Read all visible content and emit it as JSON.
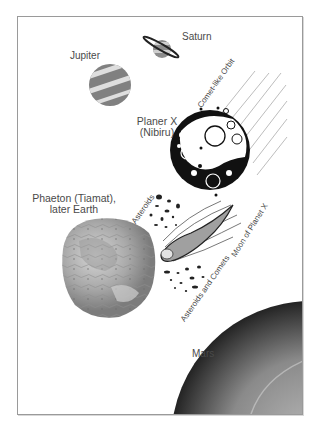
{
  "diagram": {
    "labels": {
      "saturn": "Saturn",
      "jupiter": "Jupiter",
      "comet_orbit": "Comet-like Orbit",
      "planet_x_line1": "Planer X",
      "planet_x_line2": "(Nibiru)",
      "phaeton_line1": "Phaeton (Tiamat),",
      "phaeton_line2": "later Earth",
      "asteroids": "Asteroids",
      "moon_of_planet_x": "Moon of Planet X",
      "asteroids_and_comets": "Asteroids and Comets",
      "mars": "Mars"
    },
    "colors": {
      "frame": "#9a9a9a",
      "text": "#4a4a4a",
      "planet_dark": "#111111",
      "jupiter_band_dark": "#7a7a7a",
      "jupiter_band_light": "#d8d8d8"
    }
  }
}
